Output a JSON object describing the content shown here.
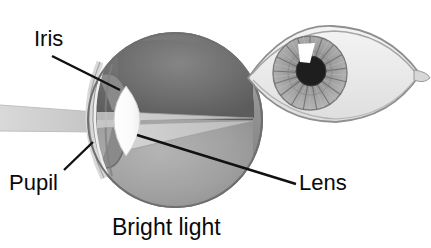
{
  "figure": {
    "title": "Bright light",
    "caption": "Bright light",
    "labels": {
      "iris": "Iris",
      "pupil": "Pupil",
      "lens": "Lens"
    },
    "icon_names": {
      "eye_cross_section": "eye-cross-section-icon",
      "eye_front_view": "eye-front-view-icon",
      "light_beam": "light-beam-icon",
      "leader_line": "leader-line-icon"
    },
    "colors": {
      "background": "#ffffff",
      "text": "#0a0a0a",
      "leader_line": "#111111",
      "sclera_ring": "#9a9a9a",
      "sclera_ring_dark": "#7d7d7d",
      "vitreous_upper": "#6e6e6e",
      "vitreous_lower": "#a3a3a3",
      "retina_cone": "#c9c9c9",
      "lens_white": "#fbfbfb",
      "cornea": "#d6d6d6",
      "iris_body": "#8d8d8d",
      "light_beam": "#d2d2d2",
      "front_eye_sclera": "#ededed",
      "front_eye_outline": "#8f8f8f",
      "front_iris": "#9b9b9b",
      "front_pupil": "#1e1e1e",
      "front_highlight": "#ffffff"
    }
  }
}
